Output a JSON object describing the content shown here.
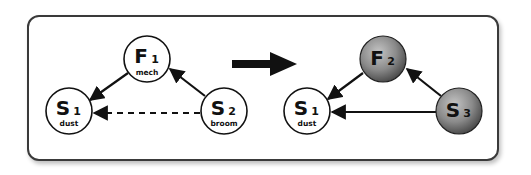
{
  "diagram": {
    "before": {
      "nodes": [
        {
          "id": "F1",
          "letter": "F",
          "sub": "1",
          "caption": "mech",
          "style": "white"
        },
        {
          "id": "S1",
          "letter": "S",
          "sub": "1",
          "caption": "dust",
          "style": "white"
        },
        {
          "id": "S2",
          "letter": "S",
          "sub": "2",
          "caption": "broom",
          "style": "white"
        }
      ],
      "edges": [
        {
          "from": "F1",
          "to": "S1",
          "style": "solid"
        },
        {
          "from": "S2",
          "to": "F1",
          "style": "solid"
        },
        {
          "from": "S2",
          "to": "S1",
          "style": "dashed"
        }
      ]
    },
    "transition_arrow": "right",
    "after": {
      "nodes": [
        {
          "id": "F2",
          "letter": "F",
          "sub": "2",
          "caption": "",
          "style": "gray-sphere"
        },
        {
          "id": "S1",
          "letter": "S",
          "sub": "1",
          "caption": "dust",
          "style": "white"
        },
        {
          "id": "S3",
          "letter": "S",
          "sub": "3",
          "caption": "",
          "style": "gray-sphere"
        }
      ],
      "edges": [
        {
          "from": "F2",
          "to": "S1",
          "style": "solid"
        },
        {
          "from": "S3",
          "to": "F2",
          "style": "solid"
        },
        {
          "from": "S3",
          "to": "S1",
          "style": "solid"
        }
      ]
    }
  },
  "labels": {
    "f1_letter": "F",
    "f1_sub": "1",
    "f1_caption": "mech",
    "s1_letter": "S",
    "s1_sub": "1",
    "s1_caption": "dust",
    "s2_letter": "S",
    "s2_sub": "2",
    "s2_caption": "broom",
    "f2_letter": "F",
    "f2_sub": "2",
    "s1b_letter": "S",
    "s1b_sub": "1",
    "s1b_caption": "dust",
    "s3_letter": "S",
    "s3_sub": "3"
  },
  "colors": {
    "stroke": "#111111",
    "sphere_light": "#b5b5b5",
    "sphere_dark": "#5a5a5a"
  }
}
